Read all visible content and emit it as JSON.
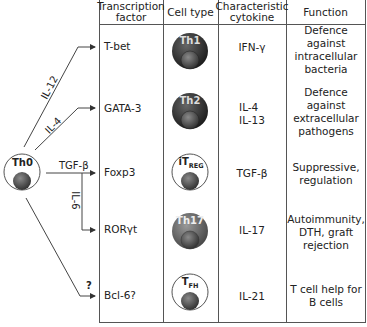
{
  "headers": {
    "transcription_factor": "Transcription factor",
    "cell_type": "Cell type",
    "cytokine": "Characteristic cytokine",
    "function": "Function"
  },
  "precursor": {
    "label": "Th0"
  },
  "pathways": [
    {
      "signal": "IL-12",
      "tf": "T-bet",
      "cell": "Th1",
      "cell_style": "dark",
      "cytokine": "IFN-γ",
      "function": "Defence against intracellular bacteria"
    },
    {
      "signal": "IL-4",
      "tf": "GATA-3",
      "cell": "Th2",
      "cell_style": "dark",
      "cytokine": "IL-4\nIL-13",
      "function": "Defence against extracellular pathogens"
    },
    {
      "signal": "TGF-β",
      "tf": "Foxp3",
      "cell": "iT",
      "cell_sub": "REG",
      "cell_style": "outline",
      "cytokine": "TGF-β",
      "function": "Suppressive, regulation"
    },
    {
      "signal": "IL-6",
      "tf": "RORγt",
      "cell": "Th17",
      "cell_style": "medium",
      "cytokine": "IL-17",
      "function": "Autoimmunity, DTH, graft rejection"
    },
    {
      "signal": "?",
      "tf": "Bcl-6?",
      "cell": "T",
      "cell_sub": "FH",
      "cell_style": "outline",
      "cytokine": "IL-21",
      "function": "T cell help for B cells"
    }
  ],
  "colors": {
    "line": "#555555",
    "dark_cell": "#2e2e2e",
    "medium_cell": "#6a6a6a",
    "nucleus": "#5a5a5a"
  }
}
